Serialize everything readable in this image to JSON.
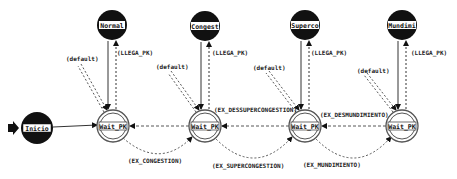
{
  "diagram": {
    "type": "state-machine",
    "start_marker": "start-arrow",
    "nodes": [
      {
        "id": "inicio",
        "label": "Inicio",
        "kind": "initial-filled",
        "x": 37,
        "y": 128
      },
      {
        "id": "normal",
        "label": "Normal",
        "kind": "filled",
        "x": 112,
        "y": 25
      },
      {
        "id": "congest",
        "label": "Congest",
        "kind": "filled",
        "x": 205,
        "y": 26
      },
      {
        "id": "superco",
        "label": "Superco",
        "kind": "filled",
        "x": 305,
        "y": 25
      },
      {
        "id": "mundimi",
        "label": "Mundimi",
        "kind": "filled",
        "x": 402,
        "y": 25
      },
      {
        "id": "wait1",
        "label": "Wait_PK",
        "kind": "double-ring",
        "x": 113,
        "y": 126
      },
      {
        "id": "wait2",
        "label": "Wait_PK",
        "kind": "double-ring",
        "x": 205,
        "y": 126
      },
      {
        "id": "wait3",
        "label": "Wait_PK",
        "kind": "double-ring",
        "x": 305,
        "y": 126
      },
      {
        "id": "wait4",
        "label": "Wait_PK",
        "kind": "double-ring",
        "x": 402,
        "y": 126
      }
    ],
    "edge_labels": {
      "llega_pk": "(LLEGA_PK)",
      "default": "(default)",
      "ex_descongestion": "(EX_DESCONGESTION)",
      "ex_dessupercongestion": "(EX_DESSUPERCONGESTION)",
      "ex_desmundimiento": "(EX_DESMUNDIMIENTO)",
      "ex_congestion": "(EX_CONGESTION)",
      "ex_supercongestion": "(EX_SUPERCONGESTION)",
      "ex_mundimiento": "(EX_MUNDIMIENTO)"
    },
    "edges": [
      {
        "from": "inicio",
        "to": "wait1",
        "style": "solid"
      },
      {
        "from": "normal",
        "to": "wait1",
        "style": "solid"
      },
      {
        "from": "wait1",
        "to": "normal",
        "style": "dashed",
        "label": "(LLEGA_PK)"
      },
      {
        "from": "congest",
        "to": "wait2",
        "style": "solid"
      },
      {
        "from": "wait2",
        "to": "congest",
        "style": "dashed",
        "label": "(LLEGA_PK)"
      },
      {
        "from": "superco",
        "to": "wait3",
        "style": "solid"
      },
      {
        "from": "wait3",
        "to": "superco",
        "style": "dashed",
        "label": "(LLEGA_PK)"
      },
      {
        "from": "mundimi",
        "to": "wait4",
        "style": "solid"
      },
      {
        "from": "wait4",
        "to": "mundimi",
        "style": "dashed",
        "label": "(LLEGA_PK)"
      },
      {
        "from": "wait1",
        "to": "wait1",
        "style": "dashed",
        "label": "(default)"
      },
      {
        "from": "wait2",
        "to": "wait2",
        "style": "dashed",
        "label": "(default)"
      },
      {
        "from": "wait3",
        "to": "wait3",
        "style": "dashed",
        "label": "(default)"
      },
      {
        "from": "wait4",
        "to": "wait4",
        "style": "dashed",
        "label": "(default)"
      },
      {
        "from": "wait2",
        "to": "wait1",
        "style": "dashed",
        "label": "(EX_DESCONGESTION)"
      },
      {
        "from": "wait3",
        "to": "wait2",
        "style": "dashed",
        "label": "(EX_DESSUPERCONGESTION)"
      },
      {
        "from": "wait4",
        "to": "wait3",
        "style": "dashed",
        "label": "(EX_DESMUNDIMIENTO)"
      },
      {
        "from": "wait1",
        "to": "wait2",
        "style": "dashed",
        "label": "(EX_CONGESTION)"
      },
      {
        "from": "wait2",
        "to": "wait3",
        "style": "dashed",
        "label": "(EX_SUPERCONGESTION)"
      },
      {
        "from": "wait3",
        "to": "wait4",
        "style": "dashed",
        "label": "(EX_MUNDIMIENTO)"
      }
    ]
  }
}
